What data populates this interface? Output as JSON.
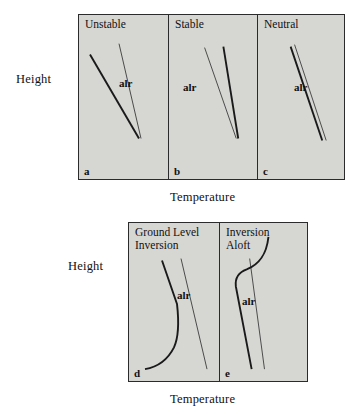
{
  "figure": {
    "height_axis_label": "Height",
    "temperature_axis_label": "Temperature",
    "alr_label": "alr",
    "colors": {
      "panel_fill": "#d6d6d2",
      "panel_border": "#2b2b2b",
      "environmental_curve": "#1a1a1a",
      "adiabatic_curve": "#4a4a4a",
      "text": "#111111",
      "background": "#ffffff"
    }
  },
  "top_row": {
    "height_label": "Height",
    "temperature_label": "Temperature",
    "panels": [
      {
        "letter": "a",
        "title": "Unstable",
        "alr_label": "alr",
        "description": "Environmental lapse rate steeper (cools faster with height) than the adiabatic lapse rate; parcel is unstable.",
        "env_path": "M 11 40 L 60 125",
        "alr_path": "M 40 29 L 62 125",
        "alr_label_pos": {
          "x": 40,
          "y": 62
        }
      },
      {
        "letter": "b",
        "title": "Stable",
        "alr_label": "alr",
        "description": "Environmental lapse rate less steep than the adiabatic lapse rate; parcel is stable.",
        "env_path": "M 55 32 L 70 125",
        "alr_path": "M 36 33 L 68 125",
        "alr_label_pos": {
          "x": 14,
          "y": 66
        }
      },
      {
        "letter": "c",
        "title": "Neutral",
        "alr_label": "alr",
        "description": "Environmental lapse rate equal to the adiabatic lapse rate; parcel is neutral.",
        "env_path": "M 33 32 L 65 127",
        "alr_path": "M 37 30 L 69 127",
        "alr_label_pos": {
          "x": 36,
          "y": 66
        }
      }
    ]
  },
  "bottom_row": {
    "height_label": "Height",
    "temperature_label": "Temperature",
    "panels": [
      {
        "letter": "d",
        "title": "Ground Level\nInversion",
        "alr_label": "alr",
        "description": "Temperature increases with height from the surface upward, then decreases; inversion based at ground level.",
        "env_path": "M 16 148 C 28 146 38 140 45 126 C 50 115 50 100 48 82 L 33 38",
        "alr_path": "M 52 36 L 78 148",
        "alr_label_pos": {
          "x": 48,
          "y": 66
        }
      },
      {
        "letter": "e",
        "title": "Inversion\nAloft",
        "alr_label": "alr",
        "description": "Temperature decreases with height, then increases through an elevated inversion layer before decreasing again.",
        "env_path": "M 32 148 L 16 64 C 15 55 19 50 27 47 C 39 42 47 33 49 14",
        "alr_path": "M 30 36 L 45 148",
        "alr_label_pos": {
          "x": 22,
          "y": 72
        }
      }
    ]
  }
}
